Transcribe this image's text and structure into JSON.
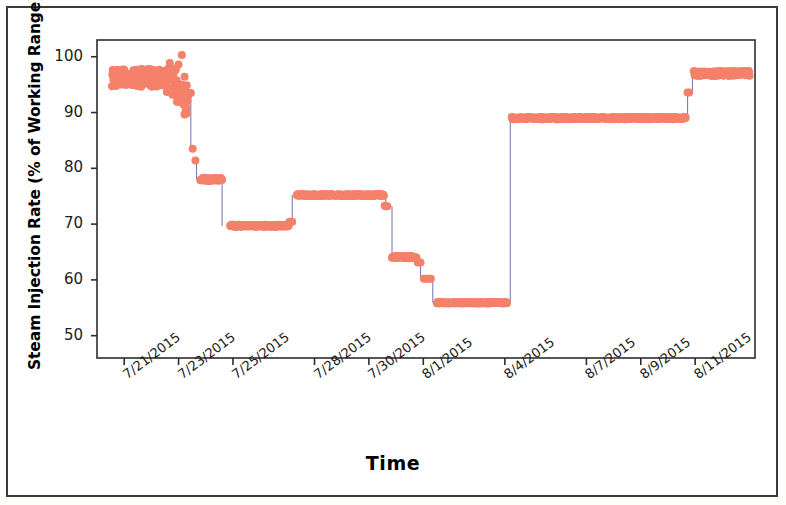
{
  "figure": {
    "kind": "scatter-step-timeseries",
    "frame_color": "#3a3a3a",
    "background": "#ffffff"
  },
  "chart_data": {
    "type": "scatter",
    "title": "",
    "subtitle": "",
    "xlabel": "Time",
    "ylabel": "Steam Injection Rate (% of Working Range)",
    "grid": false,
    "legend": null,
    "marker_color": "#F4816A",
    "line_color": "#7B7FB5",
    "marker_size": 4,
    "ylim": [
      46,
      103
    ],
    "yticks": [
      50,
      60,
      70,
      80,
      90,
      100
    ],
    "ytick_labels": [
      "50",
      "60",
      "70",
      "80",
      "90",
      "100"
    ],
    "xlim": [
      "7/20/2015",
      "8/13/2015"
    ],
    "xticks": [
      "7/21/2015",
      "7/23/2015",
      "7/25/2015",
      "7/28/2015",
      "7/30/2015",
      "8/1/2015",
      "8/4/2015",
      "8/7/2015",
      "8/9/2015",
      "8/11/2015"
    ],
    "xtick_days": [
      1.0,
      3.0,
      5.0,
      8.0,
      10.0,
      12.0,
      15.0,
      18.0,
      20.0,
      22.0
    ],
    "x_units": "days since 7/20/2015",
    "series": [
      {
        "name": "Steam Injection Rate",
        "color": "#F4816A",
        "segments": [
          {
            "label": "noisy-high-plateau",
            "level": 96.2,
            "x_start": 0.55,
            "x_end": 3.3,
            "noise": 1.6,
            "n": 200
          },
          {
            "label": "rapid-decline",
            "level": 93.5,
            "x_start": 3.3,
            "x_end": 3.45,
            "noise": 0.0,
            "n": 3
          },
          {
            "label": "step-83",
            "level": 83.5,
            "x_start": 3.52,
            "x_end": 3.56,
            "noise": 0.0,
            "n": 1
          },
          {
            "label": "step-81",
            "level": 81.4,
            "x_start": 3.62,
            "x_end": 3.66,
            "noise": 0.0,
            "n": 1
          },
          {
            "label": "plateau-78",
            "level": 78.0,
            "x_start": 3.8,
            "x_end": 4.6,
            "noise": 0.25,
            "n": 60
          },
          {
            "label": "plateau-70",
            "level": 69.7,
            "x_start": 4.9,
            "x_end": 7.05,
            "noise": 0.18,
            "n": 150
          },
          {
            "label": "notch-70b",
            "level": 70.4,
            "x_start": 7.08,
            "x_end": 7.18,
            "noise": 0.0,
            "n": 3
          },
          {
            "label": "plateau-75",
            "level": 75.2,
            "x_start": 7.35,
            "x_end": 10.55,
            "noise": 0.18,
            "n": 200
          },
          {
            "label": "step-73",
            "level": 73.2,
            "x_start": 10.62,
            "x_end": 10.68,
            "noise": 0.0,
            "n": 2
          },
          {
            "label": "plateau-64",
            "level": 64.1,
            "x_start": 10.85,
            "x_end": 11.75,
            "noise": 0.2,
            "n": 60
          },
          {
            "label": "step-63",
            "level": 63.1,
            "x_start": 11.8,
            "x_end": 11.9,
            "noise": 0.0,
            "n": 2
          },
          {
            "label": "step-60",
            "level": 60.2,
            "x_start": 12.02,
            "x_end": 12.28,
            "noise": 0.0,
            "n": 5
          },
          {
            "label": "plateau-56",
            "level": 55.9,
            "x_start": 12.5,
            "x_end": 15.08,
            "noise": 0.12,
            "n": 170
          },
          {
            "label": "plateau-89",
            "level": 89.0,
            "x_start": 15.25,
            "x_end": 21.65,
            "noise": 0.2,
            "n": 420
          },
          {
            "label": "step-93",
            "level": 93.6,
            "x_start": 21.72,
            "x_end": 21.78,
            "noise": 0.0,
            "n": 2
          },
          {
            "label": "plateau-97",
            "level": 97.0,
            "x_start": 21.95,
            "x_end": 24.0,
            "noise": 0.45,
            "n": 140
          }
        ],
        "connectors": [
          {
            "x": 3.45,
            "y_from": 93.5,
            "y_to": 83.5
          },
          {
            "x": 3.66,
            "y_from": 81.4,
            "y_to": 78.0
          },
          {
            "x": 4.6,
            "y_from": 78.0,
            "y_to": 69.7
          },
          {
            "x": 7.18,
            "y_from": 70.4,
            "y_to": 75.2
          },
          {
            "x": 10.62,
            "y_from": 75.2,
            "y_to": 73.2
          },
          {
            "x": 10.85,
            "y_from": 73.2,
            "y_to": 64.1
          },
          {
            "x": 11.9,
            "y_from": 63.1,
            "y_to": 60.2
          },
          {
            "x": 12.35,
            "y_from": 60.2,
            "y_to": 55.9
          },
          {
            "x": 15.2,
            "y_from": 55.9,
            "y_to": 89.0
          },
          {
            "x": 21.72,
            "y_from": 89.0,
            "y_to": 93.6
          },
          {
            "x": 21.9,
            "y_from": 93.6,
            "y_to": 97.0
          }
        ]
      }
    ]
  }
}
